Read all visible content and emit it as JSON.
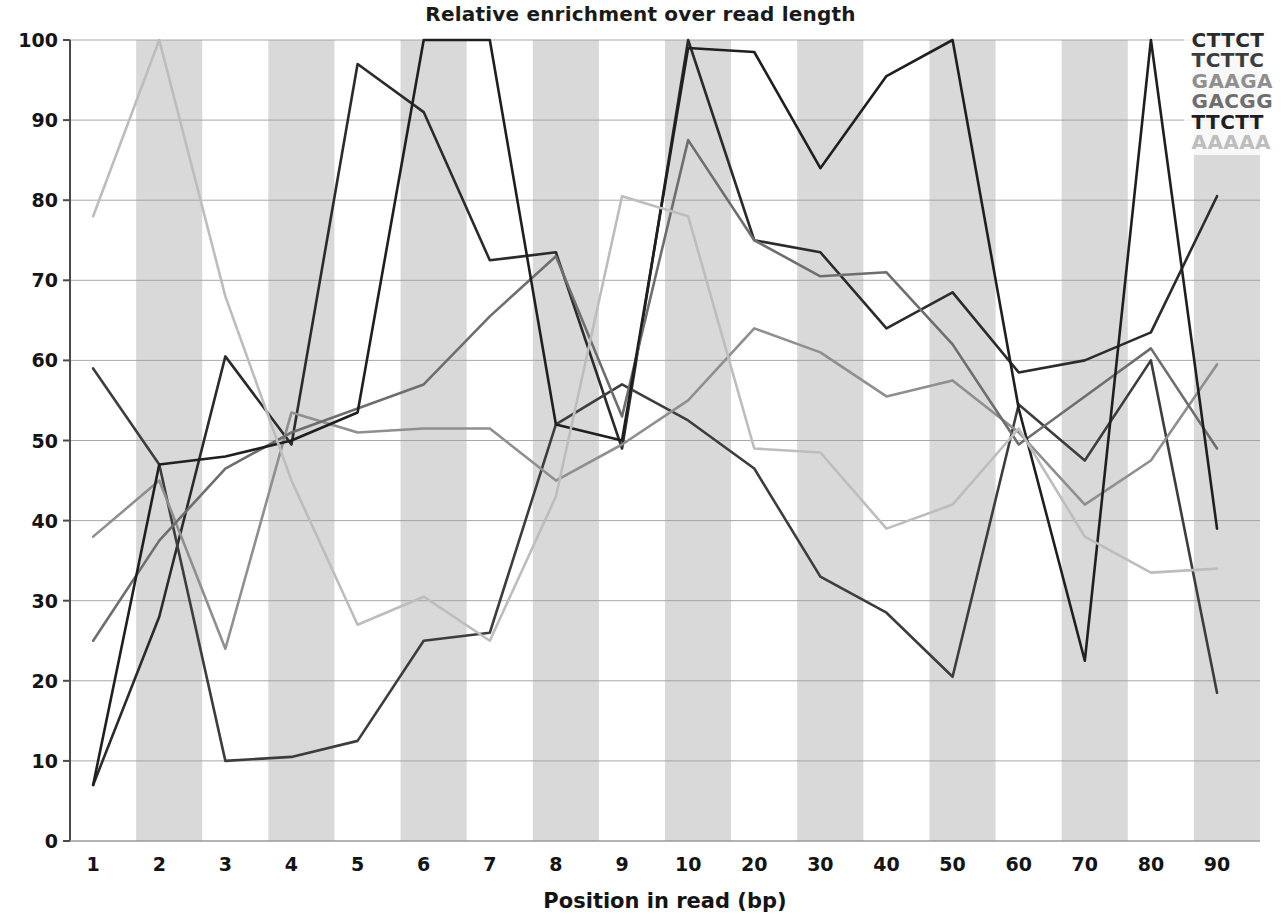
{
  "chart_data": {
    "type": "line",
    "title": "Relative enrichment over read length",
    "xlabel": "Position in read (bp)",
    "ylabel": "",
    "ylim": [
      0,
      100
    ],
    "yticks": [
      0,
      10,
      20,
      30,
      40,
      50,
      60,
      70,
      80,
      90,
      100
    ],
    "grid": true,
    "grid_axis": "y",
    "banding": "alternating vertical gray bands per x-interval",
    "legend_position": "top-right",
    "categories": [
      "1",
      "2",
      "3",
      "4",
      "5",
      "6",
      "7",
      "8",
      "9",
      "10",
      "20",
      "30",
      "40",
      "50",
      "60",
      "70",
      "80",
      "90"
    ],
    "x": [
      1,
      2,
      3,
      4,
      5,
      6,
      7,
      8,
      9,
      10,
      20,
      30,
      40,
      50,
      60,
      70,
      80,
      86
    ],
    "series": [
      {
        "name": "CTTCT",
        "color": "#2b2b2b",
        "values": [
          7,
          28,
          60.5,
          49.5,
          97,
          91,
          72.5,
          73.5,
          49,
          100,
          75,
          73.5,
          64,
          68.5,
          58.5,
          60,
          63.5,
          80.5
        ]
      },
      {
        "name": "TCTTC",
        "color": "#3d3d3d",
        "values": [
          59,
          47,
          10,
          10.5,
          12.5,
          25,
          26,
          52,
          57,
          52.5,
          46.5,
          33,
          28.5,
          20.5,
          54.5,
          47.5,
          60,
          18.5
        ]
      },
      {
        "name": "GAAGA",
        "color": "#8f8f8f",
        "values": [
          38,
          45,
          24,
          53.5,
          51,
          51.5,
          51.5,
          45,
          49.5,
          55,
          64,
          61,
          55.5,
          57.5,
          51,
          42,
          47.5,
          59.5
        ]
      },
      {
        "name": "GACGG",
        "color": "#6e6e6e",
        "values": [
          25,
          37.5,
          46.5,
          51,
          54,
          57,
          65.5,
          73,
          53,
          87.5,
          75,
          70.5,
          71,
          62,
          49.5,
          55.5,
          61.5,
          49
        ]
      },
      {
        "name": "TTCTT",
        "color": "#1f1f1f",
        "values": [
          7,
          47,
          48,
          50,
          53.5,
          100,
          100,
          52,
          50,
          99,
          98.5,
          84,
          95.5,
          100,
          54,
          22.5,
          100,
          39
        ]
      },
      {
        "name": "AAAAA",
        "color": "#bdbdbd",
        "values": [
          78,
          100,
          68,
          45,
          27,
          30.5,
          25,
          43,
          80.5,
          78,
          49,
          48.5,
          39,
          42,
          51.5,
          38,
          33.5,
          34
        ]
      }
    ]
  },
  "legend": {
    "items": [
      {
        "label": "CTTCT"
      },
      {
        "label": "TCTTC"
      },
      {
        "label": "GAAGA"
      },
      {
        "label": "GACGG"
      },
      {
        "label": "TTCTT"
      },
      {
        "label": "AAAAA"
      }
    ]
  }
}
